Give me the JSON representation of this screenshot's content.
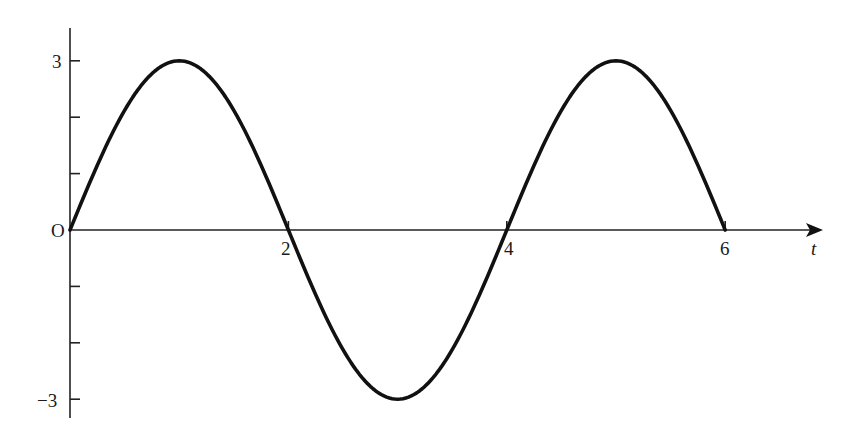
{
  "chart_data": {
    "type": "line",
    "title": "",
    "xlabel": "t",
    "ylabel": "",
    "origin_label": "O",
    "xlim": [
      0,
      6.9
    ],
    "ylim": [
      -3.3,
      3.6
    ],
    "x_ticks": [
      {
        "value": 2,
        "label": "2"
      },
      {
        "value": 4,
        "label": "4"
      },
      {
        "value": 6,
        "label": "6"
      }
    ],
    "y_ticks": [
      {
        "value": 3,
        "label": "3"
      },
      {
        "value": 2,
        "label": ""
      },
      {
        "value": 1,
        "label": ""
      },
      {
        "value": -1,
        "label": ""
      },
      {
        "value": -2,
        "label": ""
      },
      {
        "value": -3,
        "label": "−3"
      }
    ],
    "grid": false,
    "legend": null,
    "series": [
      {
        "name": "y = 3 sin(πt/2)",
        "x": [
          0,
          0.5,
          1,
          1.5,
          2,
          2.5,
          3,
          3.5,
          4,
          4.5,
          5,
          5.5,
          6
        ],
        "values": [
          0,
          2.12,
          3,
          2.12,
          0,
          -2.12,
          -3,
          -2.12,
          0,
          2.12,
          3,
          2.12,
          0
        ]
      }
    ],
    "colors": {
      "curve": "#111111",
      "axis": "#222222",
      "text": "#1a1a1a"
    }
  },
  "labels": {
    "origin": "O",
    "x_axis_name": "t",
    "x_tick_2": "2",
    "x_tick_4": "4",
    "x_tick_6": "6",
    "y_tick_3": "3",
    "y_tick_neg3": "−3"
  }
}
